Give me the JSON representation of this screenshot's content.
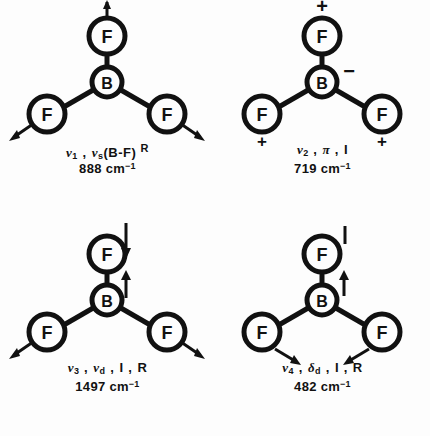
{
  "figure": {
    "molecule": "BF3",
    "center_atom": "B",
    "outer_atom": "F",
    "ink_color": "#111111",
    "background_color": "#fdfdfd"
  },
  "modes": [
    {
      "id": "nu1",
      "symbol": "ν",
      "index": "1",
      "description": "ν",
      "desc_sub": "s",
      "desc_rest": "(B-F)",
      "activity": "R",
      "wavenumber": "888",
      "unit": "cm",
      "unit_exp": "-1",
      "label_line1": "ν1 , νs(B-F) R",
      "label_line2": "888 cm-1",
      "atoms": {
        "center": "B",
        "top": "F",
        "left": "F",
        "right": "F"
      },
      "markers": {
        "top": "arrow-up",
        "left": "arrow-down-left",
        "right": "arrow-down-right",
        "center": "none"
      }
    },
    {
      "id": "nu2",
      "symbol": "ν",
      "index": "2",
      "description": "π",
      "desc_sub": "",
      "desc_rest": "",
      "activity": "I",
      "wavenumber": "719",
      "unit": "cm",
      "unit_exp": "-1",
      "label_line1": "ν2 , π , I",
      "label_line2": "719 cm-1",
      "atoms": {
        "center": "B",
        "top": "F",
        "left": "F",
        "right": "F"
      },
      "markers": {
        "top": "plus",
        "left": "plus",
        "right": "plus",
        "center": "minus"
      }
    },
    {
      "id": "nu3",
      "symbol": "ν",
      "index": "3",
      "description": "ν",
      "desc_sub": "d",
      "desc_rest": "",
      "activity": "I , R",
      "wavenumber": "1497",
      "unit": "cm",
      "unit_exp": "-1",
      "label_line1": "ν3 , νd , I , R",
      "label_line2": "1497 cm-1",
      "atoms": {
        "center": "B",
        "top": "F",
        "left": "F",
        "right": "F"
      },
      "markers": {
        "top": "arrow-down",
        "left": "arrow-down-left",
        "right": "arrow-down-right",
        "center": "arrow-up"
      }
    },
    {
      "id": "nu4",
      "symbol": "ν",
      "index": "4",
      "description": "δ",
      "desc_sub": "d",
      "desc_rest": "",
      "activity": "I , R",
      "wavenumber": "482",
      "unit": "cm",
      "unit_exp": "-1",
      "label_line1": "ν4 , δd , I , R",
      "label_line2": "482 cm-1",
      "atoms": {
        "center": "B",
        "top": "F",
        "left": "F",
        "right": "F"
      },
      "markers": {
        "top": "tick-up-right",
        "left": "arrow-in-right",
        "right": "arrow-in-left",
        "center": "arrow-up"
      }
    }
  ]
}
